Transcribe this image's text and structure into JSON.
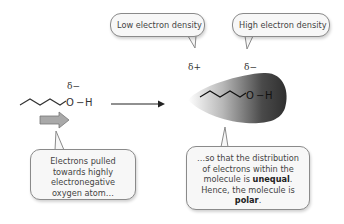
{
  "diagram": {
    "top_bubbles": [
      {
        "label": "Low electron density"
      },
      {
        "label": "High electron density"
      }
    ],
    "left_molecule": {
      "partial_charge": "δ−",
      "oxygen": "O",
      "bond": "−",
      "hydrogen": "H"
    },
    "right_molecule": {
      "partial_charge_positive": "δ+",
      "partial_charge_negative": "δ−",
      "oxygen": "O",
      "bond": "−",
      "hydrogen": "H"
    },
    "callouts": {
      "left": {
        "text": "Electrons pulled towards highly electronegative oxygen atom…"
      },
      "right": {
        "text_1": "…so that the distribution of electrons within the molecule is ",
        "bold_1": "unequal",
        "text_2": ". Hence, the molecule is ",
        "bold_2": "polar",
        "text_3": "."
      }
    },
    "colors": {
      "blob_dark": "#3a3a3a",
      "blob_light": "#ffffff",
      "bubble_fill": "#f7f7f7",
      "bubble_border": "#8a8a8a",
      "block_arrow_fill": "#a9a9a9"
    }
  }
}
